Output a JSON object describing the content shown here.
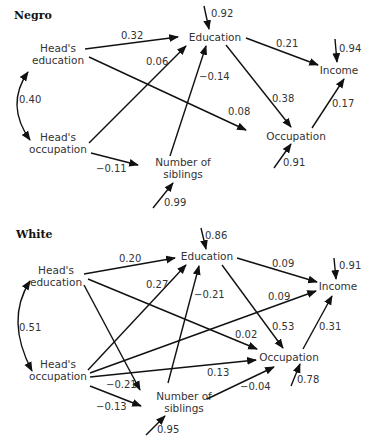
{
  "panels": [
    {
      "title": "Negro",
      "nodes": {
        "head_edu_1": "Head's",
        "head_edu_2": "education",
        "head_occ_1": "Head's",
        "head_occ_2": "occupation",
        "education": "Education",
        "income": "Income",
        "occupation": "Occupation",
        "siblings_1": "Number of",
        "siblings_2": "siblings"
      },
      "coefficients": {
        "headedu_edu": "0.32",
        "headocc_edu": "0.06",
        "sib_edu": "−0.14",
        "headedu_occ": "0.08",
        "corr": "0.40",
        "headocc_sib": "−0.11",
        "edu_inc": "0.21",
        "edu_occ": "0.38",
        "occ_inc": "0.17",
        "res_edu": "0.92",
        "res_inc": "0.94",
        "res_occ": "0.91",
        "res_sib": "0.99"
      }
    },
    {
      "title": "White",
      "nodes": {
        "head_edu_1": "Head's",
        "head_edu_2": "education",
        "head_occ_1": "Head's",
        "head_occ_2": "occupation",
        "education": "Education",
        "income": "Income",
        "occupation": "Occupation",
        "siblings_1": "Number of",
        "siblings_2": "siblings"
      },
      "coefficients": {
        "headedu_edu": "0.20",
        "headocc_edu": "0.27",
        "sib_edu": "−0.21",
        "headocc_inc": "0.09",
        "headedu_occ": "0.02",
        "corr": "0.51",
        "headocc_occ": "0.13",
        "headedu_sib": "−0.21",
        "headocc_sib": "−0.13",
        "sib_occ": "−0.04",
        "edu_inc": "0.09",
        "edu_occ": "0.53",
        "occ_inc": "0.31",
        "res_edu": "0.86",
        "res_inc": "0.91",
        "res_occ": "0.78",
        "res_sib": "0.95"
      }
    }
  ]
}
